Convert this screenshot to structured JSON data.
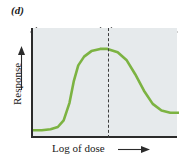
{
  "figure": {
    "panel_label": "(d)",
    "axes": {
      "y_label": "Response",
      "y_arrow": "up-arrow-icon",
      "x_label": "Log of dose",
      "x_arrow": "right-arrow-icon"
    },
    "regions": {
      "left_label_line1": "Binding to",
      "left_label_line2": "high affinity",
      "left_label_line3": "receptors",
      "right_label_line1": "Secondary",
      "right_label_line2": "binding"
    },
    "colors": {
      "curve": "#7cb342",
      "plot_background": "#e6eaec",
      "axis": "#2b2b2b",
      "divider": "#3d3d3d",
      "bracket": "#3d3d3d",
      "text": "#1a1a1a"
    }
  },
  "chart_data": {
    "type": "line",
    "title": "(d)",
    "xlabel": "Log of dose",
    "ylabel": "Response",
    "xlim": [
      0,
      1
    ],
    "ylim": [
      0,
      1
    ],
    "grid": false,
    "legend": null,
    "annotations": [
      {
        "text": "Binding to high affinity receptors",
        "region": "left",
        "x_range": [
          0,
          0.51
        ]
      },
      {
        "text": "Secondary binding",
        "region": "right",
        "x_range": [
          0.51,
          1.0
        ]
      }
    ],
    "divider_x": 0.51,
    "series": [
      {
        "name": "Biphasic dose-response",
        "x": [
          0.0,
          0.06,
          0.12,
          0.17,
          0.21,
          0.25,
          0.28,
          0.31,
          0.35,
          0.4,
          0.46,
          0.51,
          0.58,
          0.64,
          0.7,
          0.76,
          0.82,
          0.88,
          0.94,
          1.0
        ],
        "y": [
          0.07,
          0.07,
          0.08,
          0.1,
          0.16,
          0.32,
          0.52,
          0.66,
          0.74,
          0.79,
          0.81,
          0.81,
          0.78,
          0.71,
          0.58,
          0.43,
          0.31,
          0.25,
          0.23,
          0.23
        ]
      }
    ]
  }
}
